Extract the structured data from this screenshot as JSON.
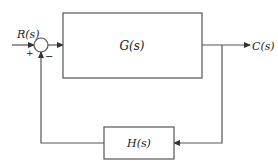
{
  "diagram": {
    "type": "feedback-control-block-diagram",
    "input_label": "R(s)",
    "output_label": "C(s)",
    "forward_block": {
      "label": "G(s)"
    },
    "feedback_block": {
      "label": "H(s)"
    },
    "summing_junction": {
      "plus_sign": "+",
      "minus_sign": "−"
    },
    "colors": {
      "stroke": "#555555",
      "text": "#1a1a1a"
    }
  }
}
